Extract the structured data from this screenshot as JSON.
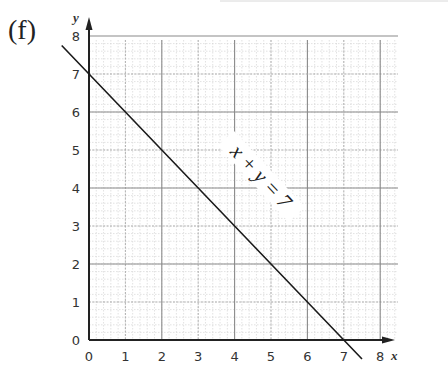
{
  "part_label": "(f)",
  "chart_data": {
    "type": "line",
    "title": "",
    "xlabel": "x",
    "ylabel": "y",
    "xlim": [
      0,
      8.5
    ],
    "ylim": [
      0,
      8.5
    ],
    "x_ticks": [
      "0",
      "1",
      "2",
      "3",
      "4",
      "5",
      "6",
      "7",
      "8"
    ],
    "y_ticks": [
      "0",
      "1",
      "2",
      "3",
      "4",
      "5",
      "6",
      "7",
      "8"
    ],
    "grid": true,
    "grid_minor_divisions": 5,
    "series": [
      {
        "name": "x + y = 7",
        "x": [
          -0.75,
          0,
          7,
          7.5
        ],
        "y": [
          7.75,
          7,
          0,
          -0.5
        ]
      }
    ],
    "annotations": [
      {
        "text": "x + y = 7",
        "x": 4.3,
        "y": 3.9,
        "rotation_deg": 47
      }
    ],
    "intercepts": {
      "x_intercept": 7,
      "y_intercept": 7
    },
    "legend": null
  }
}
